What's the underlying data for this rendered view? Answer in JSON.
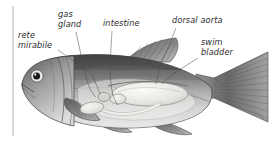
{
  "figure": {
    "background_color": "#ffffff",
    "label_color": "#2b2b2b",
    "leader_color": "#4a4a4a",
    "rule_color": "#b9b9b9",
    "body_dark": "#4f4f4f",
    "body_mid": "#8e8e8e",
    "body_light": "#d8d8d8",
    "organ_fill": "#ededea",
    "labels": [
      {
        "id": "gas-gland",
        "line1": "gas",
        "line2": "gland",
        "x": 58,
        "y1": 17,
        "y2": 27
      },
      {
        "id": "rete-mirabile",
        "line1": "rete",
        "line2": "mirabile",
        "x": 18,
        "y1": 38,
        "y2": 48
      },
      {
        "id": "intestine",
        "line1": "intestine",
        "line2": "",
        "x": 103,
        "y1": 26,
        "y2": 0
      },
      {
        "id": "dorsal-aorta",
        "line1": "dorsal aorta",
        "line2": "",
        "x": 172,
        "y1": 23,
        "y2": 0
      },
      {
        "id": "swim-bladder",
        "line1": "swim",
        "line2": "bladder",
        "x": 201,
        "y1": 45,
        "y2": 55
      }
    ]
  }
}
